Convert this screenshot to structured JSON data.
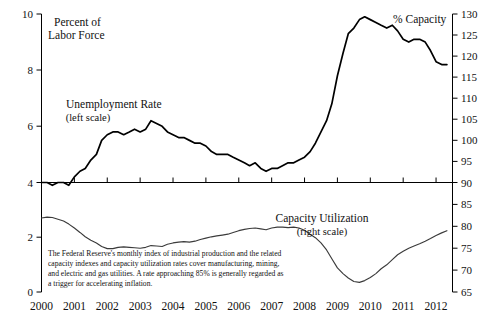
{
  "chart_data": {
    "type": "line",
    "title": "",
    "xlabel": "",
    "grid": false,
    "legend": "inline-annotations",
    "xlim": [
      2000.0,
      2012.5
    ],
    "x_ticks": [
      "2000",
      "2001",
      "2002",
      "2003",
      "2004",
      "2005",
      "2006",
      "2007",
      "2008",
      "2009",
      "2010",
      "2011",
      "2012"
    ],
    "panels": [
      {
        "name": "upper-panel",
        "ylabel_left": "Percent of Labor Force",
        "ylabel_right": "% Capacity",
        "ylim_left": [
          4,
          10
        ],
        "ylim_right": [
          90,
          130
        ],
        "y_ticks_left": [
          "10",
          "8",
          "6",
          "4"
        ],
        "y_ticks_right": [
          "130",
          "125",
          "120",
          "115",
          "110",
          "105",
          "100",
          "95",
          "90"
        ]
      },
      {
        "name": "lower-panel",
        "ylim_left": [
          0,
          4
        ],
        "ylim_right": [
          65,
          90
        ],
        "y_ticks_left": [
          "4",
          "2",
          "0"
        ],
        "y_ticks_right": [
          "90",
          "85",
          "80",
          "75",
          "70",
          "65"
        ]
      }
    ],
    "series": [
      {
        "name": "Unemployment Rate",
        "scale": "left",
        "annotation": "Unemployment Rate",
        "annotation_sub": "(left scale)",
        "units": "Percent of Labor Force",
        "x": [
          2000.0,
          2000.17,
          2000.33,
          2000.5,
          2000.67,
          2000.83,
          2001.0,
          2001.17,
          2001.33,
          2001.5,
          2001.67,
          2001.83,
          2002.0,
          2002.17,
          2002.33,
          2002.5,
          2002.67,
          2002.83,
          2003.0,
          2003.17,
          2003.33,
          2003.5,
          2003.67,
          2003.83,
          2004.0,
          2004.17,
          2004.33,
          2004.5,
          2004.67,
          2004.83,
          2005.0,
          2005.17,
          2005.33,
          2005.5,
          2005.67,
          2005.83,
          2006.0,
          2006.17,
          2006.33,
          2006.5,
          2006.67,
          2006.83,
          2007.0,
          2007.17,
          2007.33,
          2007.5,
          2007.67,
          2007.83,
          2008.0,
          2008.17,
          2008.33,
          2008.5,
          2008.67,
          2008.83,
          2009.0,
          2009.17,
          2009.33,
          2009.5,
          2009.67,
          2009.83,
          2010.0,
          2010.17,
          2010.33,
          2010.5,
          2010.67,
          2010.83,
          2011.0,
          2011.17,
          2011.33,
          2011.5,
          2011.67,
          2011.83,
          2012.0,
          2012.17,
          2012.33
        ],
        "y": [
          4.0,
          4.0,
          3.9,
          4.0,
          4.0,
          3.9,
          4.2,
          4.4,
          4.5,
          4.8,
          5.0,
          5.5,
          5.7,
          5.8,
          5.8,
          5.7,
          5.8,
          5.9,
          5.8,
          5.9,
          6.2,
          6.1,
          6.0,
          5.8,
          5.7,
          5.6,
          5.6,
          5.5,
          5.4,
          5.4,
          5.3,
          5.1,
          5.0,
          5.0,
          5.0,
          4.9,
          4.8,
          4.7,
          4.6,
          4.7,
          4.5,
          4.4,
          4.5,
          4.5,
          4.6,
          4.7,
          4.7,
          4.8,
          4.9,
          5.1,
          5.4,
          5.8,
          6.2,
          6.8,
          7.8,
          8.6,
          9.3,
          9.5,
          9.8,
          9.9,
          9.8,
          9.7,
          9.6,
          9.5,
          9.6,
          9.4,
          9.1,
          9.0,
          9.1,
          9.1,
          9.0,
          8.7,
          8.3,
          8.2,
          8.2
        ]
      },
      {
        "name": "Capacity Utilization",
        "scale": "right",
        "annotation": "Capacity Utilization",
        "annotation_sub": "(right scale)",
        "units": "% Capacity",
        "x": [
          2000.0,
          2000.17,
          2000.33,
          2000.5,
          2000.67,
          2000.83,
          2001.0,
          2001.17,
          2001.33,
          2001.5,
          2001.67,
          2001.83,
          2002.0,
          2002.17,
          2002.33,
          2002.5,
          2002.67,
          2002.83,
          2003.0,
          2003.17,
          2003.33,
          2003.5,
          2003.67,
          2003.83,
          2004.0,
          2004.17,
          2004.33,
          2004.5,
          2004.67,
          2004.83,
          2005.0,
          2005.17,
          2005.33,
          2005.5,
          2005.67,
          2005.83,
          2006.0,
          2006.17,
          2006.33,
          2006.5,
          2006.67,
          2006.83,
          2007.0,
          2007.17,
          2007.33,
          2007.5,
          2007.67,
          2007.83,
          2008.0,
          2008.17,
          2008.33,
          2008.5,
          2008.67,
          2008.83,
          2009.0,
          2009.17,
          2009.33,
          2009.5,
          2009.67,
          2009.83,
          2010.0,
          2010.17,
          2010.33,
          2010.5,
          2010.67,
          2010.83,
          2011.0,
          2011.17,
          2011.33,
          2011.5,
          2011.67,
          2011.83,
          2012.0,
          2012.17,
          2012.33
        ],
        "y": [
          81.9,
          82.1,
          82.0,
          81.6,
          81.2,
          80.5,
          79.6,
          78.6,
          77.6,
          76.8,
          76.2,
          75.4,
          74.9,
          74.9,
          75.2,
          75.3,
          75.2,
          75.1,
          75.0,
          75.2,
          75.6,
          75.5,
          75.4,
          75.9,
          76.2,
          76.4,
          76.5,
          76.4,
          76.6,
          77.0,
          77.3,
          77.6,
          77.8,
          78.0,
          78.2,
          78.6,
          79.0,
          79.3,
          79.5,
          79.6,
          79.4,
          79.2,
          79.6,
          79.8,
          79.8,
          79.7,
          79.8,
          79.6,
          79.1,
          78.2,
          77.4,
          76.2,
          74.6,
          72.6,
          70.5,
          69.2,
          68.2,
          67.4,
          67.2,
          67.6,
          68.3,
          69.2,
          70.3,
          71.2,
          72.4,
          73.5,
          74.3,
          75.0,
          75.5,
          76.0,
          76.6,
          77.2,
          77.9,
          78.5,
          79.0
        ]
      }
    ],
    "footnote": {
      "line1": "The Federal Reserve's monthly index of industrial production and the related",
      "line2": "capacity indexes and capacity utilization rates cover manufacturing, mining,",
      "line3": "and electric and gas utilities. A rate approaching 85% is generally regarded as",
      "line4": "a trigger for accelerating inflation."
    },
    "colors": {
      "line": "#000000",
      "axis": "#000000",
      "text": "#111111",
      "background": "#ffffff"
    }
  }
}
